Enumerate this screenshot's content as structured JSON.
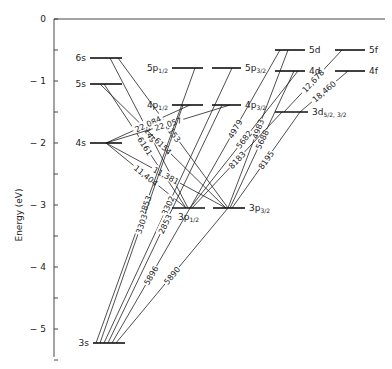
{
  "diagram": {
    "type": "grotrian",
    "ylabel": "Energy (eV)",
    "axis": {
      "ticks": [
        0,
        -1,
        -2,
        -3,
        -4,
        -5
      ],
      "tick_labels": [
        "0",
        "− 1",
        "− 2",
        "− 3",
        "− 4",
        "− 5"
      ],
      "y0px": 19,
      "px_per_ev": 62,
      "x": 54,
      "y_top": 19,
      "y_bottom": 357,
      "top_line_x_end": 385
    },
    "levels": [
      {
        "id": "6s",
        "label": "6s",
        "x1": 90,
        "x2": 122,
        "y": 58,
        "label_side": "left"
      },
      {
        "id": "5s",
        "label": "5s",
        "x1": 90,
        "x2": 122,
        "y": 84,
        "label_side": "left"
      },
      {
        "id": "4s",
        "label": "4s",
        "x1": 90,
        "x2": 122,
        "y": 143,
        "label_side": "left"
      },
      {
        "id": "3s",
        "label": "3s",
        "x1": 93,
        "x2": 125,
        "y": 343,
        "label_side": "left"
      },
      {
        "id": "5p12",
        "label": "5p",
        "sub": "1/2",
        "x1": 172,
        "x2": 203,
        "y": 68,
        "label_side": "left"
      },
      {
        "id": "4p12",
        "label": "4p",
        "sub": "1/2",
        "x1": 172,
        "x2": 203,
        "y": 105,
        "label_side": "left"
      },
      {
        "id": "3p12",
        "label": "3p",
        "sub": "1/2",
        "x1": 172,
        "x2": 205,
        "y": 208,
        "label_side": "below"
      },
      {
        "id": "5p32",
        "label": "5p",
        "sub": "3/2",
        "x1": 212,
        "x2": 241,
        "y": 68,
        "label_side": "right"
      },
      {
        "id": "4p32",
        "label": "4p",
        "sub": "3/2",
        "x1": 212,
        "x2": 241,
        "y": 105,
        "label_side": "right"
      },
      {
        "id": "3p32",
        "label": "3p",
        "sub": "3/2",
        "x1": 213,
        "x2": 245,
        "y": 208,
        "label_side": "right"
      },
      {
        "id": "5d",
        "label": "5d",
        "x1": 275,
        "x2": 305,
        "y": 50,
        "label_side": "right"
      },
      {
        "id": "4d",
        "label": "4d",
        "x1": 275,
        "x2": 305,
        "y": 71,
        "label_side": "right"
      },
      {
        "id": "3d",
        "label": "3d",
        "sub": "5/2, 3/2",
        "x1": 275,
        "x2": 308,
        "y": 112,
        "label_side": "right"
      },
      {
        "id": "5f",
        "label": "5f",
        "x1": 335,
        "x2": 365,
        "y": 50,
        "label_side": "right"
      },
      {
        "id": "4f",
        "label": "4f",
        "x1": 335,
        "x2": 365,
        "y": 71,
        "label_side": "right"
      }
    ],
    "transitions": [
      {
        "from": "6s",
        "to": "3p12",
        "label": "5149",
        "fx": 110,
        "tx": 188
      },
      {
        "from": "6s",
        "to": "3p32",
        "label": "5153",
        "fx": 118,
        "tx": 228
      },
      {
        "from": "5s",
        "to": "3p12",
        "label": "6161",
        "fx": 104,
        "tx": 186
      },
      {
        "from": "5s",
        "to": "3p32",
        "label": "6154",
        "fx": 100,
        "tx": 226
      },
      {
        "from": "4s",
        "to": "4p12",
        "label": "22,084",
        "fx": 106,
        "tx": 190
      },
      {
        "from": "4s",
        "to": "4p32",
        "label": "22,057",
        "fx": 106,
        "tx": 230
      },
      {
        "from": "4s",
        "to": "3p12",
        "label": "11,404",
        "fx": 106,
        "tx": 186
      },
      {
        "from": "4s",
        "to": "3p32",
        "label": "11,381",
        "fx": 106,
        "tx": 226
      },
      {
        "from": "3s",
        "to": "5p12",
        "label": "2853",
        "fx": 96,
        "tx": 195
      },
      {
        "from": "3s",
        "to": "5p32",
        "label": "3302",
        "fx": 104,
        "tx": 232
      },
      {
        "from": "3s",
        "to": "4p12",
        "label": "3303",
        "fx": 100,
        "tx": 183
      },
      {
        "from": "3s",
        "to": "4p32",
        "label": "2853",
        "fx": 108,
        "tx": 222
      },
      {
        "from": "3s",
        "to": "3p12",
        "label": "5896",
        "fx": 112,
        "tx": 190
      },
      {
        "from": "3s",
        "to": "3p32",
        "label": "5890",
        "fx": 116,
        "tx": 228
      },
      {
        "from": "5d",
        "to": "3p12",
        "label": "4979",
        "fx": 280,
        "tx": 190
      },
      {
        "from": "5d",
        "to": "3p32",
        "label": "4983",
        "fx": 288,
        "tx": 228
      },
      {
        "from": "4d",
        "to": "3p12",
        "label": "5682",
        "fx": 298,
        "tx": 190
      },
      {
        "from": "4d",
        "to": "3p32",
        "label": "5688",
        "fx": 294,
        "tx": 230
      },
      {
        "from": "3d",
        "to": "3p12",
        "label": "8183",
        "fx": 282,
        "tx": 192
      },
      {
        "from": "3d",
        "to": "3p32",
        "label": "8195",
        "fx": 300,
        "tx": 232
      },
      {
        "from": "5f",
        "to": "3d",
        "label": "12,678",
        "fx": 342,
        "tx": 284
      },
      {
        "from": "4f",
        "to": "3d",
        "label": "18,460",
        "fx": 348,
        "tx": 300
      }
    ]
  }
}
